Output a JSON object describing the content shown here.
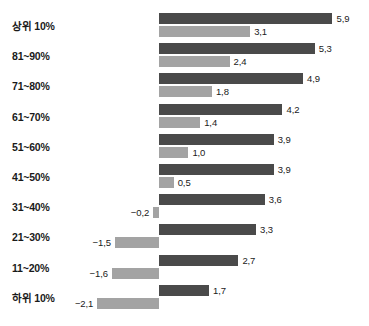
{
  "chart_data": {
    "type": "bar",
    "orientation": "horizontal",
    "title": "",
    "subtitle": "",
    "xlabel": "",
    "ylabel": "",
    "grid": false,
    "legend": null,
    "decimal_separator": ",",
    "minus_sign": "−",
    "zero_baseline": 0,
    "xlim": [
      -2.6,
      6.4
    ],
    "categories": [
      "상위 10%",
      "81~90%",
      "71~80%",
      "61~70%",
      "51~60%",
      "41~50%",
      "31~40%",
      "21~30%",
      "11~20%",
      "하위 10%"
    ],
    "series": [
      {
        "name": "series-dark",
        "color": "#4a4a4a",
        "values": [
          5.9,
          5.3,
          4.9,
          4.2,
          3.9,
          3.9,
          3.6,
          3.3,
          2.7,
          1.7
        ],
        "labels": [
          "5,9",
          "5,3",
          "4,9",
          "4,2",
          "3,9",
          "3,9",
          "3,6",
          "3,3",
          "2,7",
          "1,7"
        ]
      },
      {
        "name": "series-light",
        "color": "#a3a3a3",
        "values": [
          3.1,
          2.4,
          1.8,
          1.4,
          1.0,
          0.5,
          -0.2,
          -1.5,
          -1.6,
          -2.1
        ],
        "labels": [
          "3,1",
          "2,4",
          "1,8",
          "1,4",
          "1,0",
          "0,5",
          "−0,2",
          "−1,5",
          "−1,6",
          "−2,1"
        ]
      }
    ]
  },
  "layout": {
    "zero_x_px": 159,
    "px_per_unit": 29.4,
    "first_group_top_px": 13,
    "group_pitch_px": 30.2,
    "bar_height_px": 11,
    "bar_gap_px": 2
  }
}
